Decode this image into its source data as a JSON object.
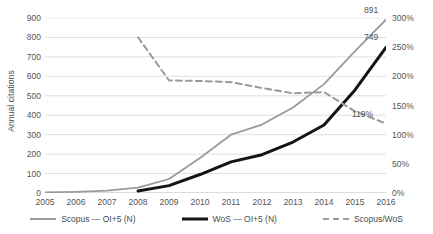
{
  "chart_data": {
    "type": "line",
    "title": "",
    "xlabel": "",
    "categories": [
      "2005",
      "2006",
      "2007",
      "2008",
      "2009",
      "2010",
      "2011",
      "2012",
      "2013",
      "2014",
      "2015",
      "2016"
    ],
    "grid": true,
    "legend_position": "bottom",
    "axes": {
      "left": {
        "label": "Annual citations",
        "ticks": [
          "0",
          "100",
          "200",
          "300",
          "400",
          "500",
          "600",
          "700",
          "800",
          "900"
        ],
        "tick_values": [
          0,
          100,
          200,
          300,
          400,
          500,
          600,
          700,
          800,
          900
        ],
        "min": 0,
        "max": 900
      },
      "right": {
        "label": "Scopus / WoS annual relative share",
        "ticks": [
          "0%",
          "50%",
          "100%",
          "150%",
          "200%",
          "250%",
          "300%"
        ],
        "tick_values": [
          0,
          50,
          100,
          150,
          200,
          250,
          300
        ],
        "min": 0,
        "max": 300
      }
    },
    "series": [
      {
        "name": "Scopus — OI+5 (N)",
        "axis": "left",
        "style": "solid",
        "color": "#9a9a9a",
        "values": [
          3,
          6,
          12,
          28,
          72,
          180,
          300,
          352,
          440,
          560,
          730,
          891
        ]
      },
      {
        "name": "WoS — OI+5 (N)",
        "axis": "left",
        "style": "solid-bold",
        "color": "#141414",
        "values": [
          null,
          null,
          null,
          10,
          38,
          95,
          160,
          197,
          262,
          350,
          530,
          749
        ]
      },
      {
        "name": "Scopus/WoS",
        "axis": "right",
        "style": "dashed",
        "color": "#9a9a9a",
        "values": [
          null,
          null,
          null,
          267,
          193,
          192,
          190,
          180,
          171,
          173,
          140,
          119
        ]
      }
    ],
    "data_labels": [
      {
        "text": "891",
        "series": "Scopus — OI+5 (N)",
        "category": "2016"
      },
      {
        "text": "749",
        "series": "WoS — OI+5 (N)",
        "category": "2016"
      },
      {
        "text": "119%",
        "series": "Scopus/WoS",
        "category": "2016"
      }
    ]
  },
  "legend": {
    "items": [
      {
        "label": "Scopus — OI+5 (N)"
      },
      {
        "label": "WoS — OI+5 (N)"
      },
      {
        "label": "Scopus/WoS"
      }
    ]
  }
}
